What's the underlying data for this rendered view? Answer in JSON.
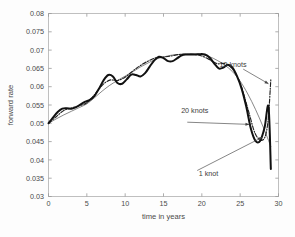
{
  "figure": {
    "background": "#fdfdfd",
    "frame_color": "#b9b9b9"
  },
  "chart_data": {
    "type": "line",
    "title": "",
    "xlabel": "time in years",
    "ylabel": "forward rate",
    "xlim": [
      0,
      30
    ],
    "ylim": [
      0.03,
      0.08
    ],
    "xticks": [
      0,
      5,
      10,
      15,
      20,
      25,
      30
    ],
    "xtick_labels": [
      "0",
      "5",
      "10",
      "15",
      "20",
      "25",
      "30"
    ],
    "yticks": [
      0.03,
      0.035,
      0.04,
      0.045,
      0.05,
      0.055,
      0.06,
      0.065,
      0.07,
      0.075,
      0.08
    ],
    "ytick_labels": [
      "0.03",
      "0.035",
      "0.04",
      "0.045",
      "0.05",
      "0.055",
      "0.06",
      "0.065",
      "0.07",
      "0.075",
      "0.08"
    ],
    "grid": false,
    "legend_position": "inline-annotations",
    "series": [
      {
        "name": "1 knot",
        "style": "thin-solid",
        "color": "#555555",
        "width": 0.7,
        "x": [
          0,
          1,
          2,
          3,
          4,
          5,
          6,
          7,
          8,
          9,
          10,
          11,
          12,
          13,
          14,
          15,
          16,
          17,
          18,
          19,
          20,
          21,
          22,
          23,
          24,
          25,
          26,
          27,
          28,
          29
        ],
        "y": [
          0.05,
          0.0512,
          0.0523,
          0.0533,
          0.0543,
          0.0553,
          0.057,
          0.0588,
          0.0604,
          0.0617,
          0.0629,
          0.0641,
          0.0654,
          0.0665,
          0.0675,
          0.0681,
          0.0686,
          0.0688,
          0.069,
          0.069,
          0.0688,
          0.0682,
          0.0672,
          0.0659,
          0.0641,
          0.0615,
          0.058,
          0.0538,
          0.049,
          0.0437
        ]
      },
      {
        "name": "10 knots",
        "style": "dash-dot",
        "color": "#222222",
        "width": 1.15,
        "x": [
          0,
          1,
          2,
          3,
          4,
          5,
          6,
          7,
          8,
          9,
          10,
          11,
          12,
          13,
          14,
          15,
          16,
          17,
          18,
          19,
          20,
          21,
          22,
          23,
          24,
          25,
          26,
          27,
          28,
          28.6,
          29
        ],
        "y": [
          0.05,
          0.0518,
          0.0535,
          0.0542,
          0.0548,
          0.0556,
          0.0578,
          0.0604,
          0.0618,
          0.0617,
          0.0626,
          0.0643,
          0.0658,
          0.067,
          0.0679,
          0.0681,
          0.0684,
          0.0688,
          0.0688,
          0.0688,
          0.0684,
          0.0674,
          0.0663,
          0.0663,
          0.0648,
          0.061,
          0.054,
          0.047,
          0.0455,
          0.05,
          0.062
        ]
      },
      {
        "name": "20 knots",
        "style": "thick-solid",
        "color": "#111111",
        "width": 2.0,
        "x": [
          0,
          0.6,
          1.2,
          1.8,
          2.4,
          3.0,
          3.6,
          4.2,
          4.8,
          5.4,
          6.0,
          6.6,
          7.2,
          7.8,
          8.4,
          9.0,
          9.6,
          10.2,
          10.8,
          11.4,
          12.0,
          12.6,
          13.2,
          13.8,
          14.4,
          15.0,
          15.6,
          16.2,
          16.8,
          17.4,
          18.0,
          18.6,
          19.2,
          19.8,
          20.4,
          21.0,
          21.6,
          22.2,
          22.8,
          23.4,
          24.0,
          24.6,
          25.2,
          25.8,
          26.4,
          27.0,
          27.6,
          28.2,
          28.7,
          29.0
        ],
        "y": [
          0.05,
          0.0516,
          0.0531,
          0.054,
          0.0541,
          0.054,
          0.0544,
          0.0552,
          0.0559,
          0.0564,
          0.0575,
          0.0595,
          0.0618,
          0.0632,
          0.0628,
          0.061,
          0.0608,
          0.062,
          0.0633,
          0.0632,
          0.0628,
          0.0637,
          0.0655,
          0.0672,
          0.0682,
          0.0678,
          0.067,
          0.067,
          0.0678,
          0.0686,
          0.0688,
          0.0688,
          0.0688,
          0.0689,
          0.0688,
          0.068,
          0.0664,
          0.065,
          0.0652,
          0.066,
          0.0652,
          0.0628,
          0.0594,
          0.0545,
          0.0485,
          0.0452,
          0.0452,
          0.049,
          0.0545,
          0.0375
        ]
      }
    ],
    "annotations": [
      {
        "name": "10 knots",
        "text": "10 knots",
        "text_x": 22.3,
        "text_y": 0.0655,
        "leader_from_x": 25.4,
        "leader_from_y": 0.0648,
        "leader_to_x": 28.7,
        "leader_to_y": 0.0608
      },
      {
        "name": "20 knots",
        "text": "20 knots",
        "text_x": 17.3,
        "text_y": 0.0527,
        "leader_from_x": 18.1,
        "leader_from_y": 0.0503,
        "leader_to_x": 26.2,
        "leader_to_y": 0.0497
      },
      {
        "name": "1 knot",
        "text": "1 knot",
        "text_x": 19.6,
        "text_y": 0.0357,
        "leader_from_x": 19.4,
        "leader_from_y": 0.0371,
        "leader_to_x": 27.9,
        "leader_to_y": 0.0462
      }
    ]
  }
}
